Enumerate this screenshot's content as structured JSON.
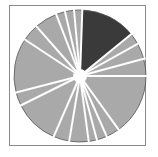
{
  "chart_data": {
    "type": "pie",
    "title": "",
    "xlabel": "",
    "ylabel": "",
    "legend": [],
    "start_angle_deg": 2,
    "direction": "clockwise",
    "center": [
      80,
      76
    ],
    "radius": 66,
    "hole_radius": 7,
    "explode_gap_px": 2,
    "colors": {
      "highlight": "#3a3a3a",
      "default": "#a9a9a9",
      "edge": "#555555",
      "gap": "#ffffff"
    },
    "categories": [
      "S1",
      "S2",
      "S3",
      "S4",
      "S5",
      "S6",
      "S7",
      "S8",
      "S9",
      "S10",
      "S11",
      "S12",
      "S13",
      "S14",
      "S15",
      "S16",
      "S17",
      "S18"
    ],
    "values": [
      13.5,
      2.8,
      3.9,
      4.2,
      15.0,
      3.3,
      2.5,
      2.0,
      4.7,
      3.9,
      11.1,
      3.3,
      13.3,
      4.2,
      5.6,
      2.2,
      2.2,
      2.0
    ],
    "highlighted_index": 0
  }
}
